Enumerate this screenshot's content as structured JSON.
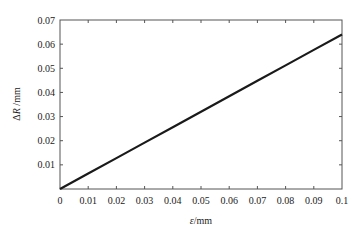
{
  "chart_data": {
    "type": "line",
    "title": "",
    "xlabel": "ε/mm",
    "ylabel": "ΔR /mm",
    "xlim": [
      0,
      0.1
    ],
    "ylim": [
      0,
      0.07
    ],
    "grid": false,
    "legend": null,
    "x_ticks": [
      "0",
      "0.01",
      "0.02",
      "0.03",
      "0.04",
      "0.05",
      "0.06",
      "0.07",
      "0.08",
      "0.09",
      "0.1"
    ],
    "y_ticks": [
      "0.01",
      "0.02",
      "0.03",
      "0.04",
      "0.05",
      "0.06",
      "0.07"
    ],
    "series": [
      {
        "name": "ΔR",
        "color": "#1a1a1a",
        "x": [
          0,
          0.01,
          0.02,
          0.03,
          0.04,
          0.05,
          0.06,
          0.07,
          0.08,
          0.09,
          0.1
        ],
        "values": [
          0,
          0.0064,
          0.0128,
          0.0192,
          0.0256,
          0.032,
          0.0384,
          0.0448,
          0.0512,
          0.0576,
          0.064
        ]
      }
    ]
  },
  "colors": {
    "axis": "#555555",
    "line": "#1a1a1a",
    "text": "#222222"
  }
}
